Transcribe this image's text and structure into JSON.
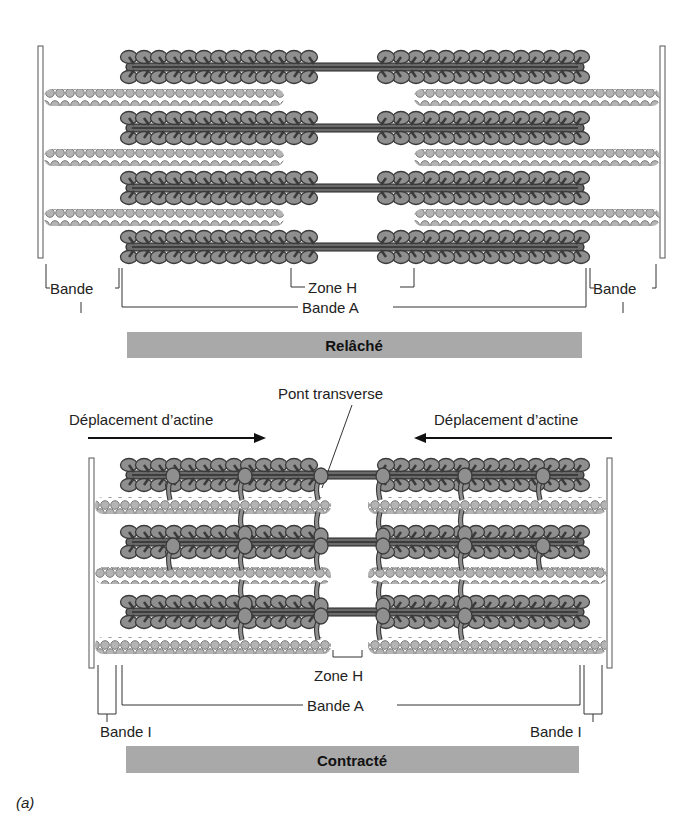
{
  "figure": {
    "panel_label": "(a)",
    "colors": {
      "myosin_head": "#8f8f8f",
      "myosin_outline": "#3a3a3a",
      "actin_bead": "#b4b4b4",
      "actin_outline": "#6e6e6e",
      "banner": "#a9a9a9",
      "zline": "#ffffff"
    },
    "relaxed": {
      "banner_label": "Relâché",
      "labels": {
        "band_i_left": "Bande",
        "band_i_left_2": "I",
        "band_i_right": "Bande",
        "band_i_right_2": "I",
        "zone_h": "Zone H",
        "band_a": "Bande A"
      }
    },
    "contracted": {
      "banner_label": "Contracté",
      "cross_bridge_label": "Pont transverse",
      "arrow_left_label": "Déplacement d’actine",
      "arrow_right_label": "Déplacement d’actine",
      "labels": {
        "zone_h": "Zone H",
        "band_a": "Bande A",
        "band_i_left": "Bande I",
        "band_i_right": "Bande I"
      }
    }
  }
}
